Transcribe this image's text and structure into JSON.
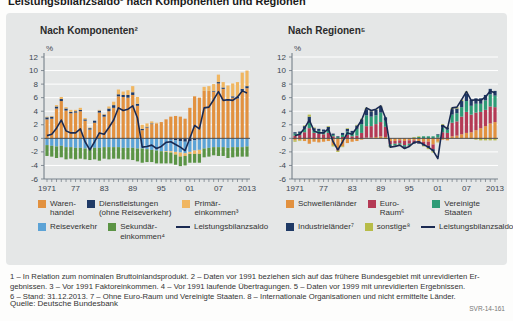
{
  "page": {
    "title": "Leistungsbilanzsaldo¹ nach Komponenten und Regionen",
    "source": "Quelle: Deutsche Bundesbank",
    "figure_id": "SVR-14-161",
    "footnotes": [
      "1 – In Relation zum nominalen Bruttoinlandsprodukt.  2 – Daten vor 1991 beziehen sich auf das frühere Bundesgebiet mit unrevidierten Er-",
      "gebnissen.  3 – Vor 1991 Faktoreinkommen.  4 – Vor 1991 laufende Übertragungen.  5 – Daten vor 1999 mit unrevidierten Ergebnissen.",
      "6 – Stand: 31.12.2013.  7 – Ohne Euro-Raum und Vereinigte Staaten.  8 –  Internationale Organisationen und nicht ermittelte Länder."
    ]
  },
  "colors": {
    "panel": "#e5e7e7",
    "grid": "#ffffff",
    "zero_line": "#4a4a4a",
    "axis": "#6b7680",
    "tick_text": "#3c4650",
    "orange": "#e2913f",
    "navy": "#1f3a66",
    "amber": "#f0b661",
    "blue": "#5ca3d6",
    "green": "#5b9445",
    "crimson": "#b43a55",
    "teal": "#2d9b76",
    "olive": "#b7bc48",
    "saldo_line": "#1a2a52"
  },
  "chart_data": [
    {
      "type": "bar",
      "subtype": "stacked-bars-with-line",
      "title": "Nach Komponenten²",
      "unit": "%",
      "ylim": [
        -6,
        12
      ],
      "ytick_step": 2,
      "grid": true,
      "years_start": 1971,
      "years_end": 2013,
      "x_ticks": [
        {
          "year": 1971,
          "label": "1971"
        },
        {
          "year": 1977,
          "label": "77"
        },
        {
          "year": 1983,
          "label": "83"
        },
        {
          "year": 1989,
          "label": "89"
        },
        {
          "year": 1995,
          "label": "95"
        },
        {
          "year": 2001,
          "label": "01"
        },
        {
          "year": 2007,
          "label": "07"
        },
        {
          "year": 2013,
          "label": "2013"
        }
      ],
      "series": [
        {
          "name": "Warenhandel",
          "color": "#e2913f",
          "values": [
            2.8,
            2.9,
            4.4,
            5.5,
            4.1,
            3.7,
            3.8,
            4.0,
            2.6,
            1.3,
            2.3,
            3.8,
            3.2,
            4.0,
            4.5,
            6.2,
            6.1,
            6.0,
            6.4,
            4.8,
            1.2,
            1.6,
            2.1,
            2.2,
            2.4,
            2.8,
            3.2,
            3.3,
            3.2,
            2.9,
            4.5,
            6.2,
            6.0,
            7.0,
            7.0,
            6.9,
            8.1,
            7.3,
            5.6,
            6.0,
            5.9,
            7.0,
            7.4
          ]
        },
        {
          "name": "Dienstleistungen (ohne Reiseverkehr)",
          "color": "#1f3a66",
          "values": [
            0.3,
            0.3,
            0.3,
            0.3,
            0.3,
            0.2,
            0.2,
            0.2,
            0.2,
            0.2,
            0.3,
            0.3,
            0.3,
            0.4,
            0.4,
            0.3,
            0.3,
            0.4,
            0.4,
            0.3,
            0.2,
            0.1,
            0.1,
            0.0,
            -0.1,
            -0.1,
            -0.2,
            -0.3,
            -0.4,
            -0.5,
            -0.4,
            -0.3,
            -0.2,
            -0.1,
            0.0,
            0.1,
            0.2,
            0.2,
            0.2,
            0.2,
            0.2,
            0.3,
            0.3
          ]
        },
        {
          "name": "Reiseverkehr",
          "color": "#5ca3d6",
          "values": [
            -1.0,
            -1.1,
            -1.2,
            -1.1,
            -1.3,
            -1.3,
            -1.4,
            -1.4,
            -1.5,
            -1.5,
            -1.4,
            -1.4,
            -1.3,
            -1.3,
            -1.3,
            -1.3,
            -1.4,
            -1.4,
            -1.4,
            -1.5,
            -1.5,
            -1.6,
            -1.7,
            -1.8,
            -1.8,
            -1.8,
            -1.7,
            -1.7,
            -1.7,
            -1.7,
            -1.6,
            -1.5,
            -1.5,
            -1.4,
            -1.4,
            -1.3,
            -1.3,
            -1.3,
            -1.4,
            -1.3,
            -1.3,
            -1.3,
            -1.2
          ]
        },
        {
          "name": "Primäreinkommen³",
          "color": "#f0b661",
          "values": [
            0.1,
            0.1,
            0.2,
            0.3,
            0.2,
            0.3,
            0.2,
            0.3,
            0.2,
            0.1,
            0.0,
            0.1,
            0.1,
            0.3,
            0.5,
            0.7,
            0.5,
            0.7,
            0.9,
            1.0,
            0.6,
            0.5,
            0.3,
            0.1,
            0.0,
            -0.1,
            -0.2,
            -0.4,
            -0.6,
            -0.4,
            -0.3,
            -0.5,
            -0.6,
            0.6,
            0.7,
            1.0,
            1.1,
            0.8,
            2.0,
            1.9,
            2.2,
            2.4,
            2.3
          ]
        },
        {
          "name": "Sekundäreinkommen⁴",
          "color": "#5b9445",
          "values": [
            -1.6,
            -1.6,
            -1.7,
            -1.7,
            -1.8,
            -1.7,
            -1.7,
            -1.6,
            -1.6,
            -1.7,
            -1.7,
            -1.9,
            -1.7,
            -1.8,
            -1.7,
            -1.7,
            -1.7,
            -1.7,
            -1.8,
            -1.9,
            -2.1,
            -1.9,
            -1.8,
            -1.9,
            -1.8,
            -1.7,
            -1.6,
            -1.5,
            -1.4,
            -1.4,
            -1.3,
            -1.3,
            -1.3,
            -1.3,
            -1.3,
            -1.2,
            -1.3,
            -1.3,
            -1.5,
            -1.5,
            -1.4,
            -1.4,
            -1.5
          ]
        }
      ],
      "line": {
        "name": "Leistungsbilanzsaldo",
        "color": "#1a2a52",
        "values": [
          0.4,
          0.6,
          1.5,
          2.7,
          1.1,
          0.8,
          0.8,
          1.4,
          -0.5,
          -1.7,
          -0.5,
          0.8,
          0.6,
          1.6,
          2.7,
          4.5,
          4.1,
          4.3,
          4.8,
          3.0,
          -1.3,
          -1.2,
          -1.0,
          -1.5,
          -1.2,
          -0.6,
          -0.5,
          -0.9,
          -1.3,
          -1.8,
          0.0,
          1.9,
          1.4,
          4.5,
          4.6,
          5.7,
          6.9,
          5.6,
          5.7,
          5.6,
          6.1,
          7.0,
          6.7
        ]
      },
      "legend": [
        [
          {
            "swatch": "box",
            "color": "#e2913f",
            "label": "Waren-\nhandel"
          },
          {
            "swatch": "box",
            "color": "#1f3a66",
            "label": "Dienstleistungen\n(ohne Reiseverkehr)"
          },
          {
            "swatch": "box",
            "color": "#f0b661",
            "label": "Primär-\neinkommen³"
          }
        ],
        [
          {
            "swatch": "box",
            "color": "#5ca3d6",
            "label": "Reiseverkehr"
          },
          {
            "swatch": "box",
            "color": "#5b9445",
            "label": "Sekundär-\neinkommen⁴"
          },
          {
            "swatch": "line",
            "color": "#1a2a52",
            "label": "Leistungsbilanzsaldo"
          }
        ]
      ]
    },
    {
      "type": "bar",
      "subtype": "stacked-bars-with-line",
      "title": "Nach Regionen⁵",
      "unit": "%",
      "ylim": [
        -6,
        12
      ],
      "ytick_step": 2,
      "grid": true,
      "years_start": 1971,
      "years_end": 2013,
      "x_ticks": [
        {
          "year": 1971,
          "label": "1971"
        },
        {
          "year": 1977,
          "label": "77"
        },
        {
          "year": 1983,
          "label": "83"
        },
        {
          "year": 1989,
          "label": "89"
        },
        {
          "year": 1995,
          "label": "95"
        },
        {
          "year": 2001,
          "label": "01"
        },
        {
          "year": 2007,
          "label": "07"
        },
        {
          "year": 2013,
          "label": "2013"
        }
      ],
      "series": [
        {
          "name": "Schwellenländer",
          "color": "#e2913f",
          "values": [
            -0.3,
            -0.3,
            -0.4,
            -0.8,
            -0.5,
            -0.6,
            -0.5,
            -0.4,
            -1.0,
            -1.6,
            -1.2,
            -0.7,
            -0.5,
            -0.4,
            -0.2,
            0.1,
            0.1,
            0.2,
            0.3,
            0.2,
            -0.4,
            -0.4,
            -0.3,
            -0.4,
            -0.3,
            -0.3,
            -0.4,
            -0.5,
            -0.5,
            -0.9,
            -0.5,
            -0.2,
            -0.3,
            0.3,
            0.4,
            0.6,
            0.8,
            0.9,
            1.2,
            1.5,
            1.8,
            2.2,
            2.4
          ]
        },
        {
          "name": "Euro-Raum⁶",
          "color": "#b43a55",
          "values": [
            0.4,
            0.5,
            0.9,
            1.5,
            0.8,
            0.7,
            0.6,
            0.8,
            0.3,
            -0.2,
            0.2,
            0.5,
            0.3,
            0.4,
            0.8,
            1.7,
            1.7,
            1.9,
            2.1,
            1.5,
            -0.5,
            -0.4,
            -0.4,
            -0.6,
            -0.5,
            -0.4,
            -0.3,
            -0.4,
            -0.6,
            -0.7,
            0.1,
            0.9,
            0.8,
            2.0,
            2.1,
            2.6,
            3.1,
            2.6,
            2.6,
            2.4,
            2.4,
            2.5,
            2.2
          ]
        },
        {
          "name": "Vereinigte Staaten",
          "color": "#2d9b76",
          "values": [
            0.3,
            0.3,
            0.5,
            0.8,
            0.4,
            0.4,
            0.4,
            0.5,
            0.2,
            0.2,
            0.3,
            0.5,
            0.5,
            1.0,
            1.3,
            1.6,
            1.4,
            1.3,
            1.4,
            0.9,
            -0.2,
            -0.2,
            -0.1,
            -0.2,
            -0.2,
            0.1,
            0.2,
            0.3,
            0.3,
            0.3,
            0.4,
            0.7,
            0.5,
            1.2,
            1.2,
            1.4,
            1.6,
            1.3,
            1.3,
            1.2,
            1.4,
            1.8,
            1.7
          ]
        },
        {
          "name": "Industrieländer⁷",
          "color": "#1f3a66",
          "values": [
            0.2,
            0.2,
            0.4,
            0.9,
            0.3,
            0.3,
            0.3,
            0.4,
            0.2,
            0.1,
            0.3,
            0.4,
            0.3,
            0.5,
            0.7,
            0.9,
            0.8,
            0.8,
            0.9,
            0.5,
            -0.1,
            -0.1,
            -0.1,
            -0.2,
            -0.1,
            -0.1,
            -0.1,
            -0.2,
            -0.3,
            -0.3,
            0.1,
            0.4,
            0.3,
            0.8,
            0.7,
            0.9,
            1.1,
            0.9,
            0.8,
            0.8,
            0.8,
            0.8,
            0.7
          ]
        },
        {
          "name": "sonstige⁸",
          "color": "#b7bc48",
          "values": [
            -0.2,
            -0.1,
            0.1,
            0.3,
            0.1,
            0.0,
            0.0,
            0.1,
            -0.2,
            -0.2,
            -0.1,
            0.1,
            0.0,
            0.1,
            0.1,
            0.2,
            0.1,
            0.1,
            0.1,
            -0.1,
            -0.1,
            -0.1,
            -0.1,
            -0.1,
            -0.1,
            0.1,
            0.1,
            -0.1,
            -0.2,
            -0.2,
            -0.1,
            0.1,
            0.1,
            0.2,
            0.2,
            0.2,
            0.3,
            -0.1,
            -0.2,
            -0.3,
            -0.3,
            -0.3,
            -0.3
          ]
        }
      ],
      "line": {
        "name": "Leistungsbilanzsaldo",
        "color": "#1a2a52",
        "values": [
          0.4,
          0.6,
          1.5,
          2.7,
          1.1,
          0.8,
          0.8,
          1.4,
          -0.5,
          -1.7,
          -0.5,
          0.8,
          0.6,
          1.6,
          2.7,
          4.5,
          4.1,
          4.3,
          4.8,
          3.0,
          -1.3,
          -1.2,
          -1.0,
          -1.5,
          -1.2,
          -0.6,
          -0.5,
          -0.9,
          -1.3,
          -1.8,
          -3.0,
          1.9,
          1.4,
          4.5,
          4.6,
          5.7,
          6.9,
          5.6,
          5.7,
          5.6,
          6.1,
          7.0,
          6.7
        ]
      },
      "legend": [
        [
          {
            "swatch": "box",
            "color": "#e2913f",
            "label": "Schwellenländer"
          },
          {
            "swatch": "box",
            "color": "#b43a55",
            "label": "Euro-Raum⁶"
          },
          {
            "swatch": "box",
            "color": "#2d9b76",
            "label": "Vereinigte Staaten"
          }
        ],
        [
          {
            "swatch": "box",
            "color": "#1f3a66",
            "label": "Industrieländer⁷"
          },
          {
            "swatch": "box",
            "color": "#b7bc48",
            "label": "sonstige⁸"
          },
          {
            "swatch": "line",
            "color": "#1a2a52",
            "label": "Leistungsbilanzsaldo"
          }
        ]
      ]
    }
  ]
}
